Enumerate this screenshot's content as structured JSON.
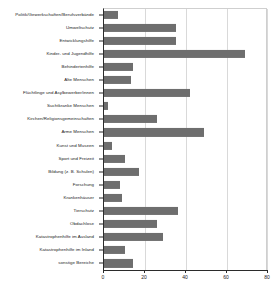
{
  "chart_data": {
    "type": "bar",
    "orientation": "horizontal",
    "title": "",
    "xlabel": "",
    "ylabel": "",
    "xlim": [
      0,
      80
    ],
    "ylim": null,
    "grid": true,
    "legend": null,
    "bar_color": "#6e6e6e",
    "xticks": [
      0,
      20,
      40,
      60,
      80
    ],
    "xtick_labels": [
      "0",
      "20",
      "40",
      "60",
      "80"
    ],
    "categories": [
      "Politik/Gewerkschaften/Berufsverbände",
      "Umweltschutz",
      "Entwicklungshilfe",
      "Kinder- und Jugendhilfe",
      "Behindertenhilfe",
      "Alte Menschen",
      "Flüchtlinge und Asylbewerber/innen",
      "Suchtkranke Menschen",
      "Kirchen/Religionsgemeinschaften",
      "Arme Menschen",
      "Kunst und Museen",
      "Sport und Freizeit",
      "Bildung (z. B. Schulen)",
      "Forschung",
      "Krankenhäuser",
      "Tierschutz",
      "Obdachlose",
      "Katastrophenhilfe im Ausland",
      "Katastrophenhilfe im Inland",
      "sonstige Bereiche"
    ],
    "values": [
      7,
      35,
      35,
      69,
      14,
      13,
      42,
      2,
      26,
      49,
      4,
      10,
      17,
      8,
      9,
      36,
      26,
      29,
      10,
      14
    ]
  }
}
